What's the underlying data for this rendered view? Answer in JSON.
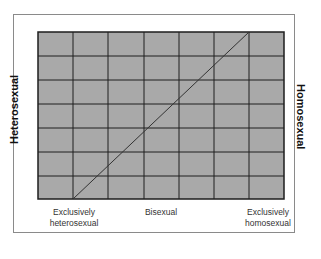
{
  "diagram": {
    "y_label_left": "Heterosexual",
    "y_label_right": "Homosexual",
    "x_labels": {
      "left": [
        "Exclusively",
        "heterosexual"
      ],
      "center": "Bisexual",
      "right": [
        "Exclusively",
        "homosexual"
      ]
    },
    "grid": {
      "columns": 7,
      "rows": 7
    },
    "colors": {
      "grid_fill": "#a9a9a9",
      "grid_lines": "#1e1e1e",
      "diagonal": "#333333",
      "frame": "#8a8a8a"
    }
  }
}
